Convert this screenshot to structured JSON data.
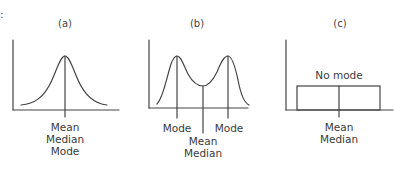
{
  "leading_mark": ":",
  "panels": [
    {
      "title": "(a)",
      "shape": "symmetric unimodal (bell curve)",
      "center_labels": [
        "Mean",
        "Median",
        "Mode"
      ]
    },
    {
      "title": "(b)",
      "shape": "bimodal",
      "mode_label_left": "Mode",
      "mode_label_right": "Mode",
      "center_labels": [
        "Mean",
        "Median"
      ]
    },
    {
      "title": "(c)",
      "shape": "uniform (rectangular)",
      "top_label": "No mode",
      "center_labels": [
        "Mean",
        "Median"
      ]
    }
  ],
  "colors": {
    "stroke": "#444444",
    "text": "#3a3a3a",
    "background": "#ffffff"
  }
}
